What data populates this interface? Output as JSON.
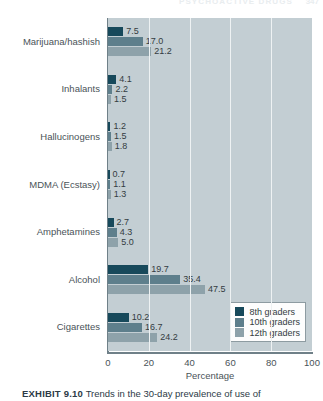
{
  "running_header": {
    "text": "PSYCHOACTIVE DRUGS",
    "page_number": "347"
  },
  "caption": {
    "exhibit_number": "EXHIBIT 9.10",
    "text": "Trends in the 30-day prevalence of use of"
  },
  "legend": {
    "position": "bottom-right",
    "items": [
      {
        "label": "8th graders",
        "color": "#17495b"
      },
      {
        "label": "10th graders",
        "color": "#5e7f8c"
      },
      {
        "label": "12th graders",
        "color": "#8ea2aa"
      }
    ]
  },
  "axis": {
    "x_title": "Percentage",
    "x_ticks": [
      "0",
      "20",
      "40",
      "60",
      "80",
      "100"
    ]
  },
  "chart_data": {
    "type": "bar",
    "orientation": "horizontal",
    "title": "",
    "subtitle": "",
    "xlabel": "Percentage",
    "ylabel": "",
    "xlim": [
      0,
      100
    ],
    "grid": true,
    "gridlines_at": [
      20,
      40,
      60,
      80
    ],
    "legend_position": "bottom-right",
    "categories": [
      "Marijuana/hashish",
      "Inhalants",
      "Hallucinogens",
      "MDMA (Ecstasy)",
      "Amphetamines",
      "Alcohol",
      "Cigarettes"
    ],
    "series": [
      {
        "name": "8th graders",
        "color": "#17495b",
        "values": [
          7.5,
          4.1,
          1.2,
          0.7,
          2.7,
          19.7,
          10.2
        ]
      },
      {
        "name": "10th graders",
        "color": "#5e7f8c",
        "values": [
          17.0,
          2.2,
          1.5,
          1.1,
          4.3,
          35.4,
          16.7
        ]
      },
      {
        "name": "12th graders",
        "color": "#8ea2aa",
        "values": [
          21.2,
          1.5,
          1.8,
          1.3,
          5.0,
          47.5,
          24.2
        ]
      }
    ],
    "value_labels": [
      [
        "7.5",
        "17.0",
        "21.2"
      ],
      [
        "4.1",
        "2.2",
        "1.5"
      ],
      [
        "1.2",
        "1.5",
        "1.8"
      ],
      [
        "0.7",
        "1.1",
        "1.3"
      ],
      [
        "2.7",
        "4.3",
        "5.0"
      ],
      [
        "19.7",
        "35.4",
        "47.5"
      ],
      [
        "10.2",
        "16.7",
        "24.2"
      ]
    ]
  }
}
